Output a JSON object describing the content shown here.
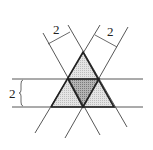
{
  "diagram": {
    "labels": {
      "left_strip_width": "2",
      "right_strip_width": "2",
      "horizontal_strip_width": "2"
    },
    "colors": {
      "line": "#333333",
      "light_shade": "#d6d6d6",
      "dark_shade": "#9a9a9a"
    }
  }
}
